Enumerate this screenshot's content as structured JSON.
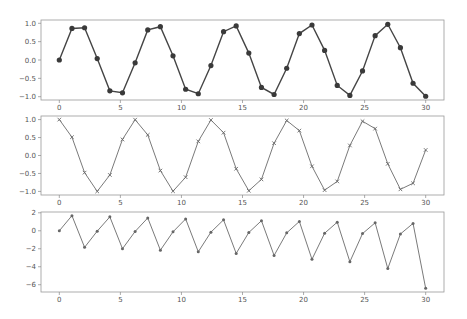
{
  "figure": {
    "width": 467,
    "height": 319,
    "background": "#ffffff"
  },
  "chart_data": [
    {
      "type": "line",
      "title": "",
      "xlabel": "",
      "ylabel": "",
      "marker": "circle",
      "line_color": "#454545",
      "marker_color": "#3a3a3a",
      "grid": false,
      "xlim": [
        -1.5,
        31.5
      ],
      "ylim": [
        -1.09,
        1.09
      ],
      "xticks": [
        0,
        5,
        10,
        15,
        20,
        25,
        30
      ],
      "yticks": [
        1.0,
        0.5,
        0.0,
        -0.5,
        -1.0
      ],
      "ytick_labels": [
        "1.0",
        "0.5",
        "0.0",
        "−0.5",
        "−1.0"
      ],
      "x": [
        0,
        1.0345,
        2.069,
        3.1034,
        4.1379,
        5.1724,
        6.2069,
        7.2414,
        8.2759,
        9.3103,
        10.3448,
        11.3793,
        12.4138,
        13.4483,
        14.4828,
        15.5172,
        16.5517,
        17.5862,
        18.6207,
        19.6552,
        20.6897,
        21.7241,
        22.7586,
        23.7931,
        24.8276,
        25.8621,
        26.8966,
        27.931,
        28.9655,
        30.0
      ],
      "values": [
        0,
        0.8598,
        0.8788,
        0.0382,
        -0.8402,
        -0.894,
        -0.0763,
        0.8191,
        0.9074,
        0.114,
        -0.7964,
        -0.9192,
        -0.1514,
        0.7723,
        0.9294,
        0.1884,
        -0.747,
        -0.9395,
        -0.2253,
        0.7206,
        0.9537,
        0.2621,
        -0.6929,
        -0.964,
        -0.2987,
        0.6641,
        0.9733,
        0.335,
        -0.6342,
        -0.988
      ],
      "box": {
        "left": 41,
        "top": 20,
        "right": 444,
        "bottom": 100
      }
    },
    {
      "type": "line",
      "title": "",
      "xlabel": "",
      "ylabel": "",
      "marker": "x",
      "line_color": "#7a7a7a",
      "marker_color": "#6a6a6a",
      "grid": false,
      "xlim": [
        -1.5,
        31.5
      ],
      "ylim": [
        -1.1,
        1.1
      ],
      "xticks": [
        0,
        5,
        10,
        15,
        20,
        25,
        30
      ],
      "yticks": [
        1.0,
        0.5,
        0.0,
        -0.5,
        -1.0
      ],
      "ytick_labels": [
        "1.0",
        "0.5",
        "0.0",
        "−0.5",
        "−1.0"
      ],
      "x": [
        0,
        1.0345,
        2.069,
        3.1034,
        4.1379,
        5.1724,
        6.2069,
        7.2414,
        8.2759,
        9.3103,
        10.3448,
        11.3793,
        12.4138,
        13.4483,
        14.4828,
        15.5172,
        16.5517,
        17.5862,
        18.6207,
        19.6552,
        20.6897,
        21.7241,
        22.7586,
        23.7931,
        24.8276,
        25.8621,
        26.8966,
        27.931,
        28.9655,
        30.0
      ],
      "values": [
        1.0,
        0.5107,
        -0.4771,
        -0.9993,
        -0.5422,
        0.448,
        0.9971,
        0.5736,
        -0.4201,
        -0.9935,
        -0.6047,
        0.3938,
        0.9885,
        0.6353,
        -0.3691,
        -0.9822,
        -0.6648,
        0.3425,
        0.9745,
        0.6932,
        -0.3006,
        -0.965,
        -0.721,
        0.2798,
        0.9544,
        0.7477,
        -0.2315,
        -0.9422,
        -0.773,
        0.1543
      ],
      "box": {
        "left": 41,
        "top": 116,
        "right": 444,
        "bottom": 195
      }
    },
    {
      "type": "line",
      "title": "",
      "xlabel": "",
      "ylabel": "",
      "marker": "star",
      "line_color": "#7a7a7a",
      "marker_color": "#666666",
      "grid": false,
      "xlim": [
        -1.5,
        31.5
      ],
      "ylim": [
        -6.81,
        2.09
      ],
      "xticks": [
        0,
        5,
        10,
        15,
        20,
        25,
        30
      ],
      "yticks": [
        2,
        0,
        -2,
        -4,
        -6
      ],
      "ytick_labels": [
        "2",
        "0",
        "−2",
        "−4",
        "−6"
      ],
      "x": [
        0,
        1.0345,
        2.069,
        3.1034,
        4.1379,
        5.1724,
        6.2069,
        7.2414,
        8.2759,
        9.3103,
        10.3448,
        11.3793,
        12.4138,
        13.4483,
        14.4828,
        15.5172,
        16.5517,
        17.5862,
        18.6207,
        19.6552,
        20.6897,
        21.7241,
        22.7586,
        23.7931,
        24.8276,
        25.8621,
        26.8966,
        27.931,
        28.9655,
        30.0
      ],
      "values": [
        0,
        1.6836,
        -1.842,
        -0.0382,
        1.5496,
        -1.9955,
        -0.0765,
        1.428,
        -2.16,
        -0.1148,
        1.317,
        -2.3343,
        -0.1532,
        1.2156,
        -2.518,
        -0.1918,
        1.1236,
        -2.743,
        -0.2312,
        1.0395,
        -3.1727,
        -0.2716,
        0.961,
        -3.4453,
        -0.313,
        0.8882,
        -4.2046,
        -0.3555,
        0.8204,
        -6.4053
      ],
      "box": {
        "left": 41,
        "top": 212,
        "right": 444,
        "bottom": 292
      }
    }
  ]
}
